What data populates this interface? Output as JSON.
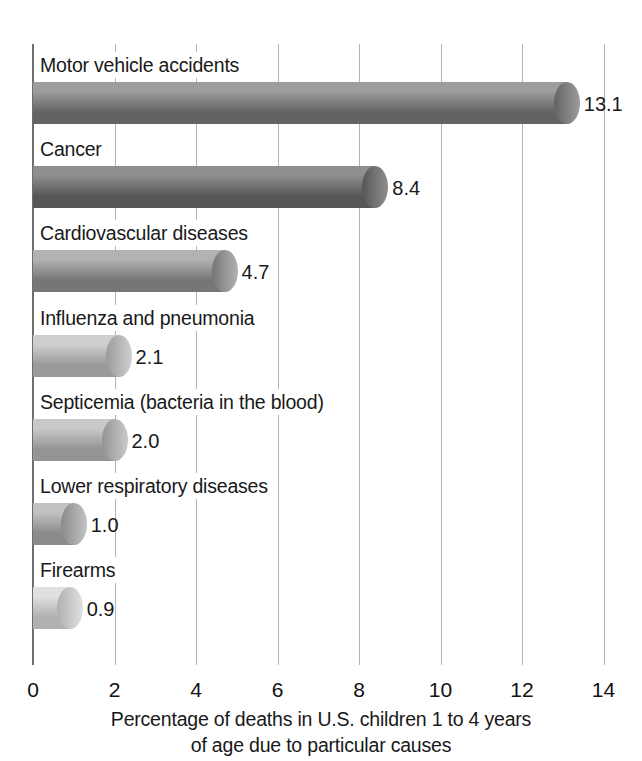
{
  "chart_data": {
    "type": "bar",
    "orientation": "horizontal",
    "title": "",
    "xlabel": "Percentage of deaths in U.S. children 1 to 4 years of age due to particular causes",
    "ylabel": "",
    "xlim": [
      0,
      14
    ],
    "xticks": [
      0,
      2,
      4,
      6,
      8,
      10,
      12,
      14
    ],
    "xtick_labels": [
      "0",
      "2",
      "4",
      "6",
      "8",
      "10",
      "12",
      "14"
    ],
    "grid": true,
    "legend": "none",
    "categories": [
      "Motor vehicle accidents",
      "Cancer",
      "Cardiovascular diseases",
      "Influenza and pneumonia",
      "Septicemia (bacteria in the blood)",
      "Lower respiratory diseases",
      "Firearms"
    ],
    "values": [
      13.1,
      8.4,
      4.7,
      2.1,
      2.0,
      1.0,
      0.9
    ],
    "value_labels": [
      "13.1",
      "8.4",
      "4.7",
      "2.1",
      "2.0",
      "1.0",
      "0.9"
    ]
  },
  "axis": {
    "caption_line1": "Percentage of deaths in U.S. children 1 to 4 years",
    "caption_line2": "of age due to particular causes"
  },
  "colors": {
    "bar_dark": "#6f6f6f",
    "bar_light": "#d8d8d8",
    "gridline": "#b4b4b4",
    "axis": "#6e6e6e",
    "text": "#191919",
    "background": "#ffffff"
  }
}
